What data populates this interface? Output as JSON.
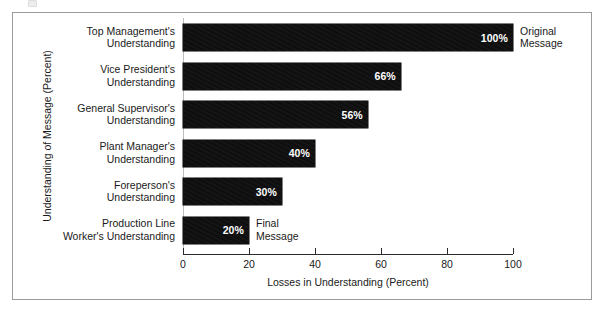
{
  "chart_data": {
    "type": "bar",
    "orientation": "horizontal",
    "title": "",
    "xlabel": "Losses in Understanding (Percent)",
    "ylabel": "Understanding of Message (Percent)",
    "xlim": [
      0,
      100
    ],
    "xticks": [
      "0",
      "20",
      "40",
      "60",
      "80",
      "100"
    ],
    "grid": false,
    "legend": null,
    "bar_color": "#0d0d0d",
    "value_label_color": "#ffffff",
    "categories": [
      "Top Management's\nUnderstanding",
      "Vice President's\nUnderstanding",
      "General Supervisor's\nUnderstanding",
      "Plant Manager's\nUnderstanding",
      "Foreperson's\nUnderstanding",
      "Production Line\nWorker's Understanding"
    ],
    "values": [
      100,
      66,
      56,
      40,
      30,
      20
    ],
    "value_labels": [
      "100%",
      "66%",
      "56%",
      "40%",
      "30%",
      "20%"
    ],
    "bars": [
      {
        "category_line1": "Top Management's",
        "category_line2": "Understanding",
        "value": 100,
        "value_label": "100%",
        "annotation_line1": "Original",
        "annotation_line2": "Message"
      },
      {
        "category_line1": "Vice President's",
        "category_line2": "Understanding",
        "value": 66,
        "value_label": "66%",
        "annotation_line1": "",
        "annotation_line2": ""
      },
      {
        "category_line1": "General Supervisor's",
        "category_line2": "Understanding",
        "value": 56,
        "value_label": "56%",
        "annotation_line1": "",
        "annotation_line2": ""
      },
      {
        "category_line1": "Plant Manager's",
        "category_line2": "Understanding",
        "value": 40,
        "value_label": "40%",
        "annotation_line1": "",
        "annotation_line2": ""
      },
      {
        "category_line1": "Foreperson's",
        "category_line2": "Understanding",
        "value": 30,
        "value_label": "30%",
        "annotation_line1": "",
        "annotation_line2": ""
      },
      {
        "category_line1": "Production Line",
        "category_line2": "Worker's Understanding",
        "value": 20,
        "value_label": "20%",
        "annotation_line1": "Final",
        "annotation_line2": "Message"
      }
    ],
    "annotations": [
      {
        "text": "Original Message",
        "at_category_index": 0
      },
      {
        "text": "Final Message",
        "at_category_index": 5
      }
    ]
  }
}
